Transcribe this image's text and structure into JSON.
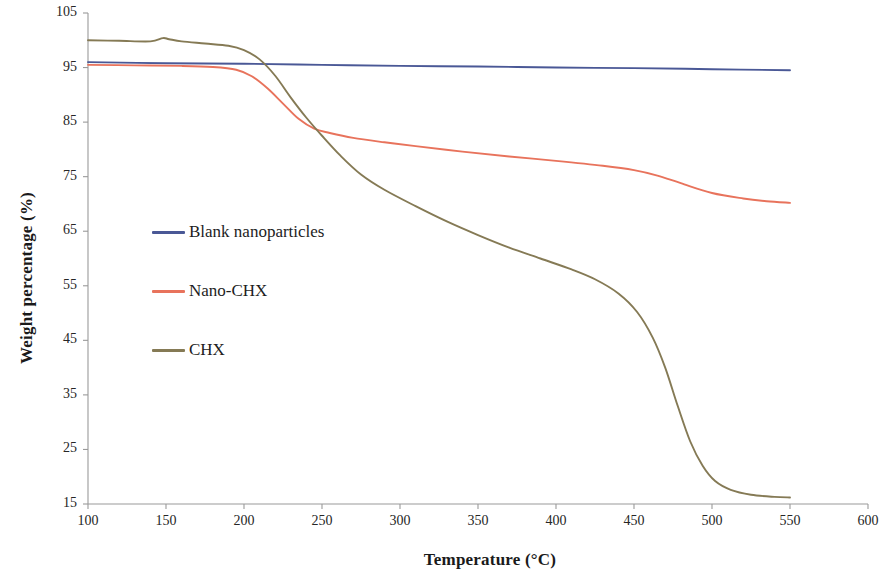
{
  "chart_data": {
    "type": "line",
    "title": "",
    "xlabel": "Temperature (°C)",
    "ylabel": "Weight percentage (%)",
    "xlim": [
      100,
      600
    ],
    "ylim": [
      15,
      105
    ],
    "xticks": [
      100,
      150,
      200,
      250,
      300,
      350,
      400,
      450,
      500,
      550,
      600
    ],
    "yticks": [
      15,
      25,
      35,
      45,
      55,
      65,
      75,
      85,
      95,
      105
    ],
    "grid": false,
    "legend_position": "center-left-inside",
    "series": [
      {
        "name": "Blank nanoparticles",
        "color": "#4a5896",
        "x": [
          100,
          150,
          200,
          250,
          300,
          350,
          400,
          450,
          500,
          550
        ],
        "values": [
          96.0,
          95.8,
          95.7,
          95.5,
          95.3,
          95.2,
          95.0,
          94.9,
          94.7,
          94.5
        ]
      },
      {
        "name": "Nano-CHX",
        "color": "#e8735c",
        "x": [
          100,
          130,
          160,
          180,
          195,
          205,
          215,
          225,
          235,
          245,
          255,
          270,
          290,
          310,
          340,
          370,
          400,
          430,
          450,
          465,
          480,
          500,
          520,
          535,
          550
        ],
        "values": [
          95.5,
          95.4,
          95.3,
          95.1,
          94.6,
          93.4,
          91.2,
          88.4,
          85.6,
          83.8,
          83.0,
          82.1,
          81.3,
          80.6,
          79.6,
          78.7,
          77.9,
          77.0,
          76.2,
          75.2,
          73.8,
          72.0,
          71.0,
          70.5,
          70.2
        ]
      },
      {
        "name": "CHX",
        "color": "#857a55",
        "x": [
          100,
          120,
          140,
          148,
          152,
          160,
          175,
          190,
          200,
          210,
          220,
          230,
          240,
          250,
          262,
          275,
          290,
          310,
          330,
          350,
          370,
          390,
          410,
          425,
          440,
          452,
          462,
          470,
          478,
          486,
          494,
          502,
          512,
          525,
          540,
          550
        ],
        "values": [
          100.0,
          99.9,
          99.8,
          100.4,
          100.2,
          99.8,
          99.4,
          99.0,
          98.2,
          96.5,
          93.5,
          89.5,
          85.8,
          82.5,
          78.8,
          75.4,
          72.6,
          69.6,
          66.8,
          64.3,
          62.0,
          60.0,
          58.0,
          56.2,
          53.6,
          50.2,
          45.5,
          40.0,
          33.0,
          26.5,
          22.0,
          19.2,
          17.6,
          16.7,
          16.3,
          16.2
        ]
      }
    ]
  },
  "legend": {
    "items": [
      {
        "label": "Blank nanoparticles",
        "color": "#4a5896"
      },
      {
        "label": "Nano-CHX",
        "color": "#e8735c"
      },
      {
        "label": "CHX",
        "color": "#857a55"
      }
    ]
  },
  "axes": {
    "y_title": "Weight percentage (%)",
    "x_title": "Temperature (°C)",
    "y_tick_labels": [
      "105",
      "95",
      "85",
      "75",
      "65",
      "55",
      "45",
      "35",
      "25",
      "15"
    ],
    "x_tick_labels": [
      "100",
      "150",
      "200",
      "250",
      "300",
      "350",
      "400",
      "450",
      "500",
      "550",
      "600"
    ]
  },
  "colors": {
    "axis": "#9a9a9a",
    "text": "#1a1a1a",
    "background": "#ffffff"
  }
}
